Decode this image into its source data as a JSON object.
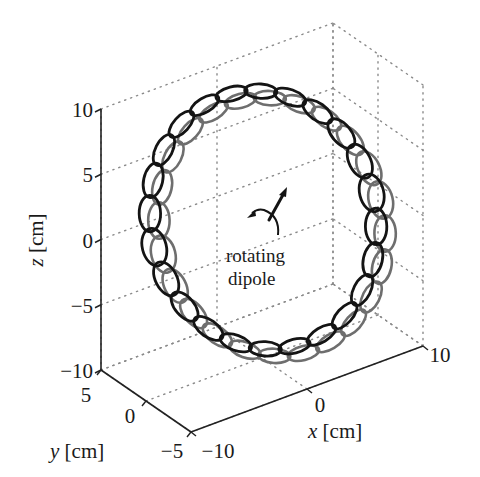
{
  "figure": {
    "title": "",
    "annotation": {
      "line1": "rotating",
      "line2": "dipole"
    },
    "axes": {
      "x": {
        "label_var": "x",
        "label_unit": " [cm]",
        "ticks": [
          "−10",
          "0",
          "10"
        ],
        "values": [
          -10,
          0,
          10
        ]
      },
      "y": {
        "label_var": "y",
        "label_unit": " [cm]",
        "ticks": [
          "−5",
          "0",
          "5"
        ],
        "values": [
          -5,
          0,
          5
        ]
      },
      "z": {
        "label_var": "z",
        "label_unit": " [cm]",
        "ticks": [
          "−10",
          "−5",
          "0",
          "5",
          "10"
        ],
        "values": [
          -10,
          -5,
          0,
          5,
          10
        ]
      }
    },
    "colors": {
      "front_ellipse": "#141414",
      "back_ellipse": "#6e6e6e",
      "grid": "#8a8a8a",
      "axis": "#222222"
    }
  },
  "chart_data": {
    "type": "3d-scatter-glyphs",
    "title": "",
    "xlabel": "x [cm]",
    "ylabel": "y [cm]",
    "zlabel": "z [cm]",
    "xlim": [
      -10,
      10
    ],
    "ylim": [
      -5,
      5
    ],
    "zlim": [
      -10,
      10
    ],
    "grid": true,
    "annotation": "rotating dipole (at origin)",
    "ring": {
      "description": "Ring of sensor/field-polarization ellipses around a rotating dipole; each location shows a black (front) and gray (back) ellipse",
      "center": [
        0,
        0,
        0
      ],
      "radius_cm": 8.5,
      "count": 24,
      "series": [
        {
          "name": "ellipse set 1",
          "color": "#141414"
        },
        {
          "name": "ellipse set 2",
          "color": "#6e6e6e"
        }
      ]
    }
  }
}
